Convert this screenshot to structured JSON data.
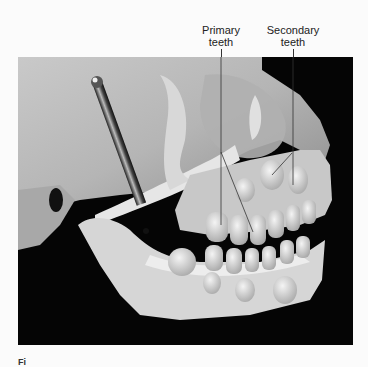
{
  "figure": {
    "labels": [
      {
        "id": "primary",
        "line1": "Primary",
        "line2": "teeth"
      },
      {
        "id": "secondary",
        "line1": "Secondary",
        "line2": "teeth"
      }
    ],
    "photo_subject": "Child skull lateral view showing primary and secondary teeth in maxilla and mandible",
    "caption_fragment": "Fi"
  }
}
